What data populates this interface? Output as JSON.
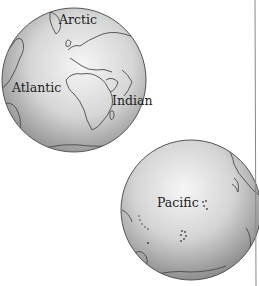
{
  "globes": [
    {
      "name": "atlantic-hemisphere",
      "labels": [
        "Arctic",
        "Atlantic",
        "Indian"
      ]
    },
    {
      "name": "pacific-hemisphere",
      "labels": [
        "Pacific"
      ]
    }
  ],
  "colors": {
    "globe_light": "#f4f4f4",
    "globe_dark": "#9a9a9a",
    "outline": "#555555",
    "coast": "#4a4a4a",
    "divider": "#888888"
  }
}
